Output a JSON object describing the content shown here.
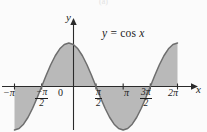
{
  "figure": {
    "caption": "(a)",
    "background_color": "#fbfbfb",
    "width": 207,
    "height": 132
  },
  "annotation": {
    "equation_lhs": "y",
    "equation_eq": " = ",
    "equation_rhs_fn": "cos",
    "equation_rhs_var": "x"
  },
  "axes": {
    "x_label": "x",
    "y_label": "y",
    "x_arrow": "arrow-right-icon",
    "y_arrow": "arrow-up-icon"
  },
  "ticks": [
    {
      "id": "neg-pi",
      "label": "−π",
      "type": "plain",
      "x_value": -3.14159
    },
    {
      "id": "neg-pi-half",
      "num": "−π",
      "den": "2",
      "type": "fraction",
      "x_value": -1.5708
    },
    {
      "id": "zero",
      "label": "0",
      "type": "plain",
      "x_value": 0
    },
    {
      "id": "pi-half",
      "num": "π",
      "den": "2",
      "type": "fraction",
      "x_value": 1.5708
    },
    {
      "id": "pi",
      "label": "π",
      "type": "plain",
      "x_value": 3.14159
    },
    {
      "id": "3pi-half",
      "num": "3π",
      "den": "2",
      "type": "fraction",
      "x_value": 4.71239
    },
    {
      "id": "2pi",
      "label": "2π",
      "type": "plain",
      "x_value": 6.28319
    }
  ],
  "chart_data": {
    "type": "line",
    "title": "",
    "subtitle": "",
    "xlabel": "x",
    "ylabel": "y",
    "annotation_text": "y = cos x",
    "function": "y = cos(x)",
    "grid": false,
    "legend": false,
    "xlim": [
      -3.14159,
      6.28319
    ],
    "ylim": [
      -1,
      1
    ],
    "xtick_values": [
      -3.14159,
      -1.5708,
      0,
      1.5708,
      3.14159,
      4.71239,
      6.28319
    ],
    "xtick_labels": [
      "−π",
      "−π/2",
      "0",
      "π/2",
      "π",
      "3π/2",
      "2π"
    ],
    "ytick_values": [],
    "ytick_labels": [],
    "shaded_region": {
      "description": "area between curve and x-axis, shaded gray, from -pi to 2pi",
      "fill_color": "#b9b9b9",
      "x_start": -3.14159,
      "x_end": 6.28319
    },
    "curve_color": "#6e6e6e",
    "axis_color": "#2a2a2a",
    "x": [
      -3.14159,
      -2.87979,
      -2.61799,
      -2.35619,
      -2.0944,
      -1.8326,
      -1.5708,
      -1.309,
      -1.0472,
      -0.785398,
      -0.523599,
      -0.261799,
      0,
      0.261799,
      0.523599,
      0.785398,
      1.0472,
      1.309,
      1.5708,
      1.8326,
      2.0944,
      2.35619,
      2.61799,
      2.87979,
      3.14159,
      3.40339,
      3.66519,
      3.92699,
      4.18879,
      4.45059,
      4.71239,
      4.97419,
      5.23599,
      5.49779,
      5.75959,
      6.02139,
      6.28319
    ],
    "y": [
      -1,
      -0.96593,
      -0.86603,
      -0.70711,
      -0.5,
      -0.25882,
      0,
      0.25882,
      0.5,
      0.70711,
      0.86603,
      0.96593,
      1,
      0.96593,
      0.86603,
      0.70711,
      0.5,
      0.25882,
      0,
      -0.25882,
      -0.5,
      -0.70711,
      -0.86603,
      -0.96593,
      -1,
      -0.96593,
      -0.86603,
      -0.70711,
      -0.5,
      -0.25882,
      0,
      0.25882,
      0.5,
      0.70711,
      0.86603,
      0.96593,
      1
    ]
  }
}
